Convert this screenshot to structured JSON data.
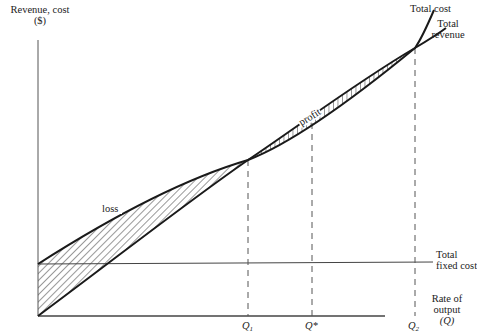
{
  "diagram": {
    "type": "break-even-analysis",
    "y_axis": {
      "label_line1": "Revenue, cost",
      "label_line2": "($)"
    },
    "x_axis": {
      "label_line1": "Rate of",
      "label_line2": "output",
      "label_line3": "(Q)"
    },
    "curves": {
      "total_cost": "Total cost",
      "total_revenue_line1": "Total",
      "total_revenue_line2": "revenue",
      "total_fixed_cost_line1": "Total",
      "total_fixed_cost_line2": "fixed cost"
    },
    "regions": {
      "loss": "loss",
      "profit": "profit"
    },
    "ticks": {
      "q1": "Q",
      "q1_sub": "1",
      "qstar": "Q*",
      "q2": "Q",
      "q2_sub": "2"
    },
    "colors": {
      "line": "#1a1a1a",
      "hatch": "#333333",
      "background": "#ffffff"
    }
  }
}
